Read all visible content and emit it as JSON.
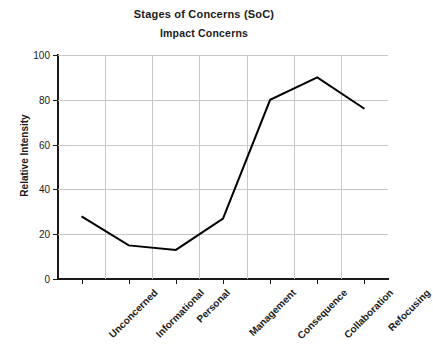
{
  "chart_data": {
    "type": "line",
    "title": "Stages of Concerns (SoC)",
    "subtitle": "Impact Concerns",
    "xlabel": "",
    "ylabel": "Relative Intensity",
    "categories": [
      "Unconcerned",
      "Informational",
      "Personal",
      "Management",
      "Consequence",
      "Collaboration",
      "Refocusing"
    ],
    "values": [
      28,
      15,
      13,
      27,
      80,
      90,
      76
    ],
    "series": [
      {
        "name": "Impact Concerns",
        "values": [
          28,
          15,
          13,
          27,
          80,
          90,
          76
        ]
      }
    ],
    "ylim": [
      0,
      100
    ],
    "yticks": [
      0,
      20,
      40,
      60,
      80,
      100
    ],
    "ytick_labels": [
      "0",
      "20",
      "40",
      "60",
      "80",
      "100"
    ],
    "grid": true,
    "legend": false,
    "line_color": "#000000",
    "line_width": 2,
    "markers": false,
    "xlabel_rotation": -45
  }
}
